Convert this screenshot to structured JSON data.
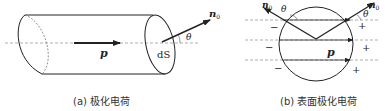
{
  "panels": [
    {
      "id": "a",
      "caption": "(a) 极化电荷",
      "labels": {
        "polarization": "p",
        "surface_element": "dS",
        "normal": "n",
        "normal_sub": "0",
        "angle": "θ"
      }
    },
    {
      "id": "b",
      "caption": "(b) 表面极化电荷",
      "labels": {
        "polarization": "p",
        "normal_left": "n",
        "normal_left_sub": "0",
        "normal_right": "n",
        "normal_right_sub": "0",
        "angle_left": "θ",
        "angle_right": "θ",
        "negative_charges": [
          "−",
          "−",
          "−"
        ],
        "positive_charges": [
          "+",
          "+",
          "+"
        ]
      }
    }
  ],
  "colors": {
    "line": "#222222",
    "dashed": "#9a9a9a",
    "background": "#ffffff"
  }
}
